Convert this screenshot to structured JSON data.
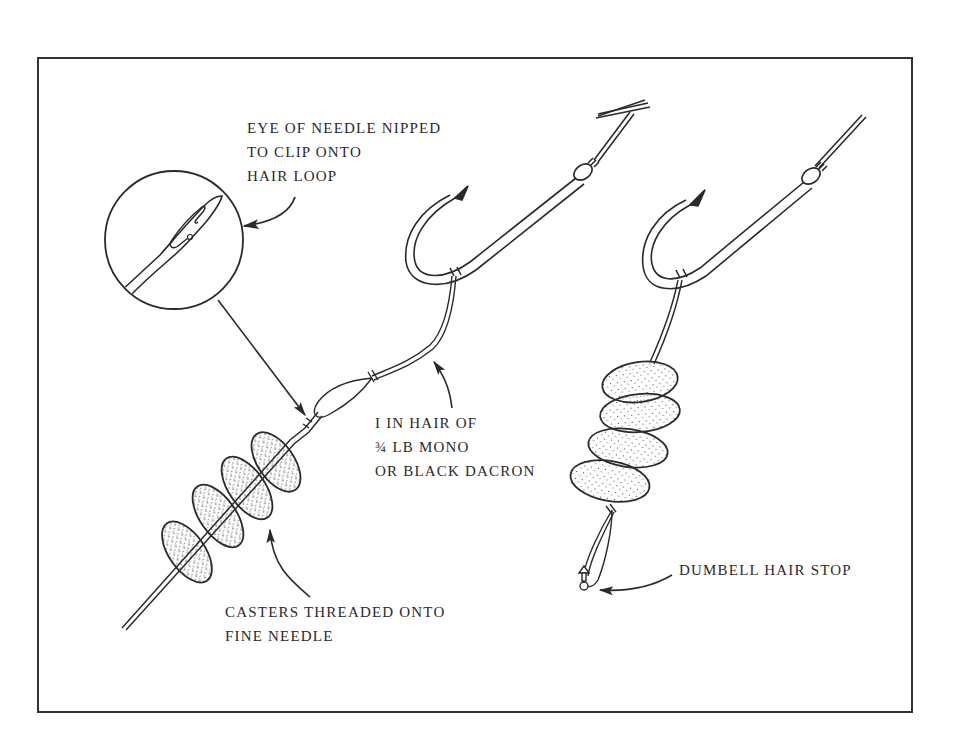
{
  "diagram": {
    "colors": {
      "ink": "#2a2a2a",
      "frame": "#333333",
      "background": "#ffffff"
    },
    "labels": {
      "needle_eye": {
        "lines": [
          "EYE OF NEEDLE NIPPED",
          "TO CLIP ONTO",
          "HAIR LOOP"
        ]
      },
      "hair_material": {
        "lines": [
          "I IN HAIR OF",
          "¾ LB MONO",
          "OR BLACK DACRON"
        ]
      },
      "casters": {
        "lines": [
          "CASTERS THREADED ONTO",
          "FINE NEEDLE"
        ]
      },
      "hair_stop": {
        "lines": [
          "DUMBELL HAIR STOP"
        ]
      }
    },
    "elements": {
      "inset_circle": "magnified needle eye",
      "left_hook": "hook with hair loop and needle",
      "right_hook": "hook with four casters on hair",
      "left_casters_count": 4,
      "right_casters_count": 4
    }
  }
}
